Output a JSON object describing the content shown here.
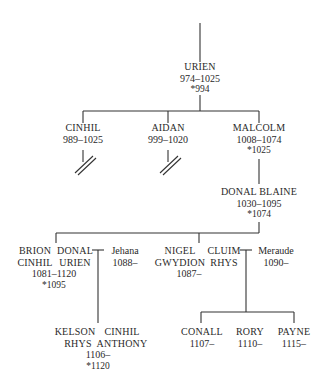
{
  "diagram": {
    "type": "family-tree",
    "nodes": {
      "urien": {
        "name": "URIEN",
        "years": "974–1025",
        "crowned": "*994"
      },
      "cinhil": {
        "name": "CINHIL",
        "years": "989–1025"
      },
      "aidan": {
        "name": "AIDAN",
        "years": "999–1020"
      },
      "malcolm": {
        "name": "MALCOLM",
        "years": "1008–1074",
        "crowned": "*1025"
      },
      "donal_blaine": {
        "name": "DONAL BLAINE",
        "years": "1030–1095",
        "crowned": "*1074"
      },
      "brion": {
        "name_line1": "BRION",
        "name_line2": "CINHIL",
        "years": "1081–1120",
        "crowned": "*1095"
      },
      "donal_urien": {
        "name_line1": "DONAL",
        "name_line2": "URIEN"
      },
      "jehana": {
        "name": "Jehana",
        "years": "1088–"
      },
      "nigel": {
        "name_line1": "NIGEL",
        "name_line2": "GWYDION",
        "years": "1087–"
      },
      "cluim": {
        "name_line1": "CLUIM",
        "name_line2": "RHYS"
      },
      "meraude": {
        "name": "Meraude",
        "years": "1090–"
      },
      "kelson": {
        "name_line1": "KELSON",
        "name_line2": "RHYS"
      },
      "cinhil_anthony": {
        "name_line1": "CINHIL",
        "name_line2": "ANTHONY"
      },
      "kelson_cinhil_shared": {
        "years": "1106–",
        "crowned": "*1120"
      },
      "conall": {
        "name": "CONALL",
        "years": "1107–"
      },
      "rory": {
        "name": "RORY",
        "years": "1110–"
      },
      "payne": {
        "name": "PAYNE",
        "years": "1115–"
      }
    },
    "edges": [
      [
        "urien",
        "cinhil"
      ],
      [
        "urien",
        "aidan"
      ],
      [
        "urien",
        "malcolm"
      ],
      [
        "malcolm",
        "donal_blaine"
      ],
      [
        "donal_blaine",
        "brion"
      ],
      [
        "donal_blaine",
        "donal_urien"
      ],
      [
        "donal_blaine",
        "nigel"
      ],
      [
        "donal_blaine",
        "cluim"
      ],
      [
        "donal_urien+jehana",
        "kelson"
      ],
      [
        "donal_urien+jehana",
        "cinhil_anthony"
      ],
      [
        "cluim+meraude",
        "conall"
      ],
      [
        "cluim+meraude",
        "rory"
      ],
      [
        "cluim+meraude",
        "payne"
      ]
    ],
    "marks": {
      "line_ended_no_issue": [
        "cinhil",
        "aidan"
      ]
    }
  }
}
